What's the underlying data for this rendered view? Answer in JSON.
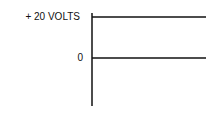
{
  "diagram": {
    "type": "voltage-level-diagram",
    "labels": {
      "top_level": "+ 20 VOLTS",
      "zero_level": "0"
    },
    "levels": [
      {
        "name": "dc-level",
        "volts": 20
      },
      {
        "name": "zero-baseline",
        "volts": 0
      }
    ],
    "colors": {
      "ink": "#111111",
      "background": "#ffffff"
    }
  }
}
